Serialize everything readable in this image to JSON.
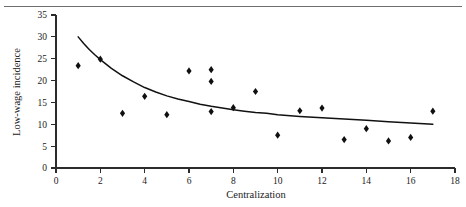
{
  "chart_data": {
    "type": "scatter",
    "title": "",
    "xlabel": "Centralization",
    "ylabel": "Low-wage incidence",
    "xlim": [
      0,
      18
    ],
    "ylim": [
      0,
      35
    ],
    "xticks": [
      0,
      2,
      4,
      6,
      8,
      10,
      12,
      14,
      16,
      18
    ],
    "yticks": [
      0,
      5,
      10,
      15,
      20,
      25,
      30,
      35
    ],
    "grid": false,
    "legend": null,
    "legend_position": "none",
    "marker_style": "filled-diamond",
    "points": [
      {
        "x": 1,
        "y": 23.4
      },
      {
        "x": 2,
        "y": 24.9
      },
      {
        "x": 3,
        "y": 12.5
      },
      {
        "x": 4,
        "y": 16.4
      },
      {
        "x": 5,
        "y": 12.2
      },
      {
        "x": 6,
        "y": 22.2
      },
      {
        "x": 7,
        "y": 22.5
      },
      {
        "x": 7,
        "y": 19.8
      },
      {
        "x": 7,
        "y": 12.9
      },
      {
        "x": 8,
        "y": 13.8
      },
      {
        "x": 9,
        "y": 17.5
      },
      {
        "x": 10,
        "y": 7.5
      },
      {
        "x": 11,
        "y": 13.1
      },
      {
        "x": 12,
        "y": 13.7
      },
      {
        "x": 13,
        "y": 6.5
      },
      {
        "x": 14,
        "y": 9.0
      },
      {
        "x": 15,
        "y": 6.2
      },
      {
        "x": 16,
        "y": 7.0
      },
      {
        "x": 17,
        "y": 13.0
      }
    ],
    "fit_curve": {
      "name": "fitted trend",
      "x": [
        1.0,
        1.25,
        1.5,
        1.75,
        2.0,
        2.5,
        3.0,
        3.5,
        4.0,
        4.5,
        5.0,
        5.5,
        6.0,
        6.5,
        7.0,
        7.5,
        8.0,
        8.5,
        9.0,
        9.5,
        10.0,
        11.0,
        12.0,
        13.0,
        14.0,
        15.0,
        16.0,
        17.0
      ],
      "y": [
        30.0,
        28.5,
        27.1,
        25.9,
        24.8,
        22.8,
        21.1,
        19.7,
        18.4,
        17.4,
        16.5,
        15.8,
        15.2,
        14.6,
        14.1,
        13.7,
        13.3,
        13.0,
        12.7,
        12.5,
        12.2,
        11.8,
        11.5,
        11.2,
        10.9,
        10.6,
        10.3,
        10.0
      ]
    }
  },
  "labels": {
    "y_axis_title": "Low-wage incidence",
    "x_axis_title": "Centralization",
    "y_ticks": [
      "0",
      "5",
      "10",
      "15",
      "20",
      "25",
      "30",
      "35"
    ],
    "x_ticks": [
      "0",
      "2",
      "4",
      "6",
      "8",
      "10",
      "12",
      "14",
      "16",
      "18"
    ]
  },
  "colors": {
    "marker": "#101010",
    "curve": "#111111",
    "axis": "#2b2b2b",
    "rule": "#6e6e6e",
    "background": "#ffffff"
  }
}
